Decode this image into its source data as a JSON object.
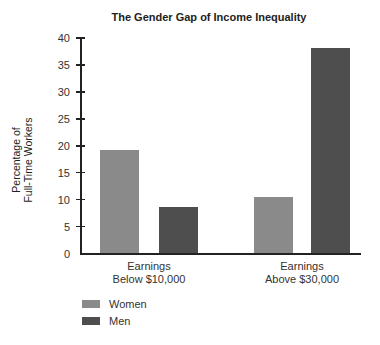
{
  "chart_data": {
    "type": "bar",
    "title": "The Gender Gap of Income Inequality",
    "xlabel": "",
    "ylabel": "Percentage of Full-Time Workers",
    "ylabel_lines": [
      "Percentage of",
      "Full-Time Workers"
    ],
    "ylim": [
      0,
      40
    ],
    "yticks": [
      0,
      5,
      10,
      15,
      20,
      25,
      30,
      35,
      40
    ],
    "grid": false,
    "legend_position": "bottom-left",
    "categories": [
      "Earnings Below $10,000",
      "Earnings Above $30,000"
    ],
    "category_lines": [
      [
        "Earnings",
        "Below $10,000"
      ],
      [
        "Earnings",
        "Above $30,000"
      ]
    ],
    "series": [
      {
        "name": "Women",
        "color": "#8a8a8a",
        "values": [
          19.3,
          10.4
        ]
      },
      {
        "name": "Men",
        "color": "#4e4e4e",
        "values": [
          8.6,
          38.1
        ]
      }
    ]
  }
}
